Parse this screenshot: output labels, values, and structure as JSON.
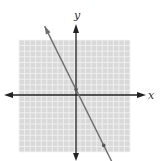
{
  "chart_data": {
    "type": "line",
    "title": "",
    "xlabel": "x",
    "ylabel": "y",
    "grid": true,
    "xlim": [
      -10,
      10
    ],
    "ylim": [
      -10,
      10
    ],
    "tick_labels_visible": false,
    "series": [
      {
        "name": "line",
        "equation": "y = -2x + 1",
        "slope": -2,
        "intercept": 1,
        "points": [
          {
            "x": 0,
            "y": 1
          },
          {
            "x": 5,
            "y": -9
          }
        ],
        "arrows_both_ends": true
      }
    ],
    "axes": {
      "x_arrows": true,
      "y_arrows": true
    }
  },
  "labels": {
    "x_axis": "x",
    "y_axis": "y"
  },
  "colors": {
    "grid_background": "#d9d9d9",
    "grid_lines": "#f4f4f4",
    "axis": "#222222",
    "line": "#6e6e6e",
    "point": "#555555"
  }
}
